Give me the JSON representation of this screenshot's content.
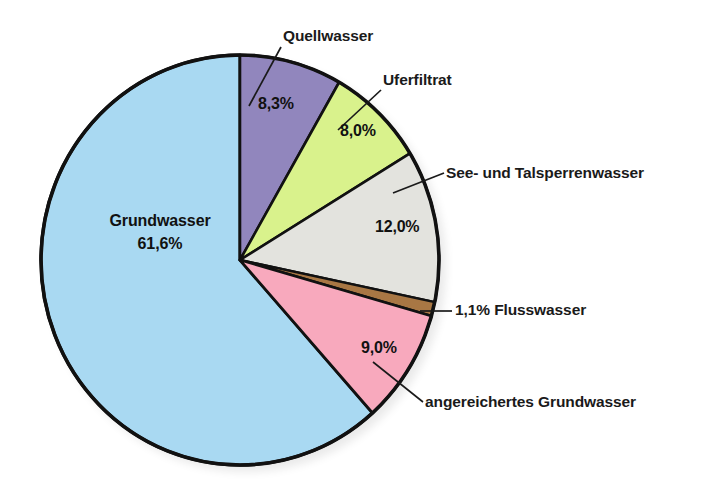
{
  "chart_data": {
    "type": "pie",
    "title": "",
    "subtitle": "",
    "xlabel": "",
    "ylabel": "",
    "legend_position": "none",
    "grid": false,
    "units": "%",
    "start_angle_deg": 0,
    "direction": "clockwise",
    "categories": [
      "Grundwasser",
      "Quellwasser",
      "Uferfiltrat",
      "See- und Talsperrenwasser",
      "Flusswasser",
      "angereichertes Grundwasser"
    ],
    "values": [
      61.6,
      8.3,
      8.0,
      12.0,
      1.1,
      9.0
    ],
    "slices": [
      {
        "name": "Quellwasser",
        "label": "Quellwasser",
        "value": 8.3,
        "value_label": "8,3%",
        "color": "#9186bd",
        "label_position": "callout-top"
      },
      {
        "name": "Uferfiltrat",
        "label": "Uferfiltrat",
        "value": 8.0,
        "value_label": "8,0%",
        "color": "#d9f28c",
        "label_position": "callout-top-right"
      },
      {
        "name": "See- und Talsperrenwasser",
        "label": "See- und Talsperrenwasser",
        "value": 12.0,
        "value_label": "12,0%",
        "color": "#e3e3de",
        "label_position": "callout-right"
      },
      {
        "name": "Flusswasser",
        "label": "1,1% Flusswasser",
        "value": 1.1,
        "value_label": "1,1%",
        "color": "#a87744",
        "label_position": "callout-right-inline"
      },
      {
        "name": "angereichertes Grundwasser",
        "label": "angereichertes Grundwasser",
        "value": 9.0,
        "value_label": "9,0%",
        "color": "#f8a9bd",
        "label_position": "callout-bottom-right"
      },
      {
        "name": "Grundwasser",
        "label": "Grundwasser",
        "value": 61.6,
        "value_label": "61,6%",
        "color": "#a9d9f2",
        "label_position": "inside"
      }
    ]
  },
  "colors": {
    "outline": "#111111",
    "background": "#ffffff",
    "text": "#1a1a1a",
    "quellwasser": "#9186bd",
    "uferfiltrat": "#d9f28c",
    "see_und_talsperrenwasser": "#e3e3de",
    "flusswasser": "#a87744",
    "angereichertes_grundwasser": "#f8a9bd",
    "grundwasser": "#a9d9f2"
  }
}
